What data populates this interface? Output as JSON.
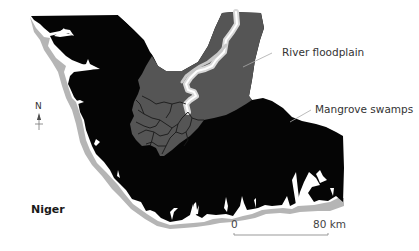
{
  "map": {
    "title": "Niger",
    "region_label": "Niger",
    "legend_labels": {
      "floodplain": "River floodplain",
      "mangrove": "Mangrove swamps"
    },
    "compass": {
      "direction": "N",
      "icon": "north-arrow-icon"
    },
    "scale_bar": {
      "start": "0",
      "end": "80 km"
    },
    "colors": {
      "mangrove": "#050505",
      "floodplain": "#555555",
      "river": "#d8d8d8",
      "beach": "#b5b5b5",
      "channels": "#1a1a1a",
      "leader_line": "#aaaaaa",
      "background": "#ffffff"
    }
  }
}
